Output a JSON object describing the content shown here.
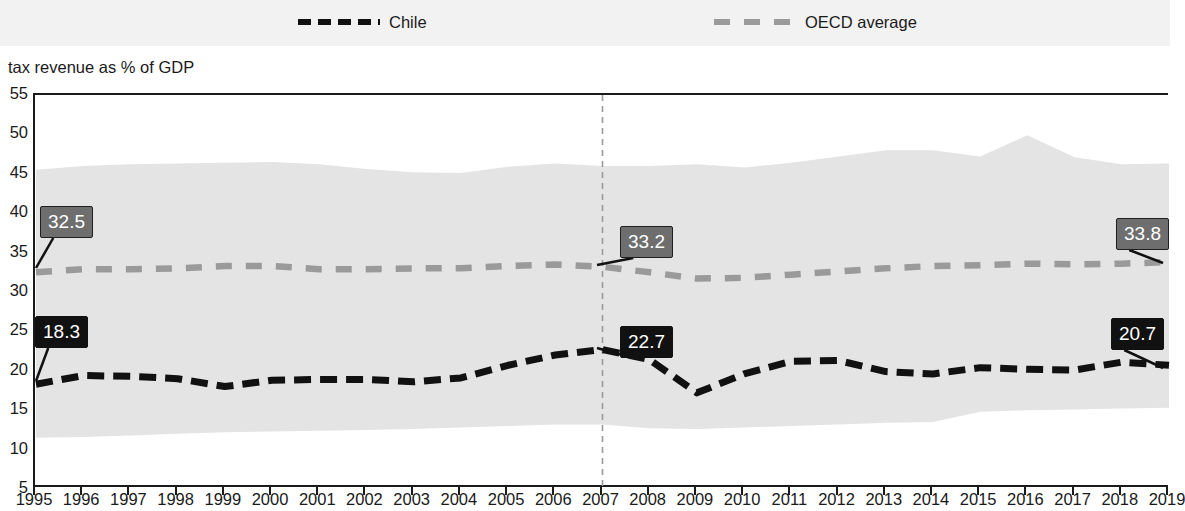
{
  "legend": {
    "items": [
      {
        "name": "chile",
        "label": "Chile",
        "color": "#111111",
        "style": "dashed"
      },
      {
        "name": "oecd",
        "label": "OECD average",
        "color": "#9a9a9a",
        "style": "dashed"
      }
    ]
  },
  "axis_title": "tax revenue as % of GDP",
  "callouts": [
    {
      "name": "oecd-1995",
      "text": "32.5",
      "style": "grey",
      "x": 40,
      "y": 206,
      "anchor_x": 36,
      "anchor_y": 268
    },
    {
      "name": "chile-1995",
      "text": "18.3",
      "style": "dark",
      "x": 35,
      "y": 316,
      "anchor_x": 36,
      "anchor_y": 381
    },
    {
      "name": "oecd-2007",
      "text": "33.2",
      "style": "grey",
      "x": 620,
      "y": 226,
      "anchor_x": 597,
      "anchor_y": 265
    },
    {
      "name": "chile-2007",
      "text": "22.7",
      "style": "dark",
      "x": 620,
      "y": 326,
      "anchor_x": 597,
      "anchor_y": 348
    },
    {
      "name": "oecd-2019",
      "text": "33.8",
      "style": "grey",
      "x": 1116,
      "y": 218,
      "anchor_x": 1163,
      "anchor_y": 263
    },
    {
      "name": "chile-2019",
      "text": "20.7",
      "style": "dark",
      "x": 1111,
      "y": 318,
      "anchor_x": 1163,
      "anchor_y": 368
    }
  ],
  "chart_data": {
    "type": "line",
    "title": "",
    "xlabel": "",
    "ylabel": "tax revenue as % of GDP",
    "ylim": [
      5,
      55
    ],
    "yticks": [
      5,
      10,
      15,
      20,
      25,
      30,
      35,
      40,
      45,
      50,
      55
    ],
    "grid": false,
    "legend_position": "top",
    "categories": [
      1995,
      1996,
      1997,
      1998,
      1999,
      2000,
      2001,
      2002,
      2003,
      2004,
      2005,
      2006,
      2007,
      2008,
      2009,
      2010,
      2011,
      2012,
      2013,
      2014,
      2015,
      2016,
      2017,
      2018,
      2019
    ],
    "series": [
      {
        "name": "Chile",
        "color": "#111111",
        "style": "dashed",
        "values": [
          18.3,
          19.4,
          19.3,
          19.0,
          18.0,
          18.8,
          18.9,
          18.9,
          18.6,
          19.1,
          20.7,
          22.0,
          22.7,
          21.4,
          17.2,
          19.6,
          21.2,
          21.3,
          19.9,
          19.6,
          20.4,
          20.2,
          20.1,
          21.1,
          20.7
        ]
      },
      {
        "name": "OECD average",
        "color": "#9a9a9a",
        "style": "dashed",
        "values": [
          32.5,
          32.9,
          32.9,
          33.0,
          33.3,
          33.3,
          32.9,
          32.9,
          33.0,
          33.0,
          33.3,
          33.5,
          33.2,
          32.5,
          31.7,
          31.8,
          32.2,
          32.6,
          33.0,
          33.3,
          33.4,
          33.6,
          33.5,
          33.6,
          33.8
        ]
      }
    ],
    "band": {
      "name": "OECD country range",
      "color": "#e4e4e4",
      "upper": [
        45.5,
        46.0,
        46.2,
        46.3,
        46.4,
        46.5,
        46.2,
        45.6,
        45.2,
        45.1,
        45.9,
        46.3,
        46.0,
        46.0,
        46.2,
        45.8,
        46.4,
        47.2,
        48.0,
        48.0,
        47.2,
        49.9,
        47.1,
        46.2,
        46.3
      ],
      "lower": [
        11.5,
        11.6,
        11.8,
        12.0,
        12.2,
        12.3,
        12.4,
        12.5,
        12.6,
        12.8,
        13.0,
        13.2,
        13.2,
        12.7,
        12.6,
        12.8,
        13.0,
        13.2,
        13.4,
        13.5,
        14.8,
        15.0,
        15.1,
        15.2,
        15.3
      ]
    },
    "reference_line": {
      "name": "year-2007",
      "x": 2007,
      "style": "dashed",
      "color": "#9a9a9a"
    },
    "data_labels": [
      {
        "series": "OECD average",
        "x": 1995,
        "value": 32.5
      },
      {
        "series": "Chile",
        "x": 1995,
        "value": 18.3
      },
      {
        "series": "OECD average",
        "x": 2007,
        "value": 33.2
      },
      {
        "series": "Chile",
        "x": 2007,
        "value": 22.7
      },
      {
        "series": "OECD average",
        "x": 2019,
        "value": 33.8
      },
      {
        "series": "Chile",
        "x": 2019,
        "value": 20.7
      }
    ]
  }
}
